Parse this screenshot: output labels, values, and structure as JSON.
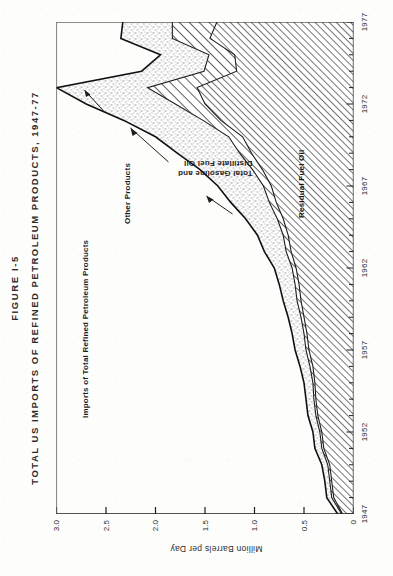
{
  "figure": {
    "number": "FIGURE I-5",
    "title": "TOTAL US IMPORTS OF REFINED PETROLEUM PRODUCTS, 1947-77"
  },
  "axes": {
    "y_axis_label": "Million Barrels per Day",
    "y_ticks": [
      "3.0",
      "2.5",
      "2.0",
      "1.5",
      "1.0",
      "0.5",
      "0"
    ],
    "x_ticks": [
      "1947",
      "1952",
      "1957",
      "1962",
      "1967",
      "1972",
      "1977"
    ]
  },
  "annotations": {
    "total_imports": "Imports of Total Refined Petroleum Products",
    "other_products": "Other Products",
    "gasoline_distillate": "Total Gasoline and\nDistillate Fuel Oil",
    "gasoline_distillate_line1": "Total Gasoline and",
    "gasoline_distillate_line2": "Distillate Fuel Oil",
    "residual": "Residual Fuel Oil"
  },
  "colors": {
    "ink": "#1d1d1d",
    "paper": "#fdfdfb",
    "stipple": "#bdbdbd",
    "hatch_dense": "#6f6f6f",
    "hatch_wide": "#4f4f4f"
  },
  "chart_data": {
    "type": "area",
    "title": "TOTAL US IMPORTS OF REFINED PETROLEUM PRODUCTS, 1947-77",
    "xlabel": "",
    "ylabel": "Million Barrels per Day",
    "ylim": [
      0,
      3.0
    ],
    "xlim": [
      1947,
      1977
    ],
    "grid": false,
    "legend": "in-plot annotations",
    "stacked": true,
    "x": [
      1947,
      1948,
      1949,
      1950,
      1951,
      1952,
      1953,
      1954,
      1955,
      1956,
      1957,
      1958,
      1959,
      1960,
      1961,
      1962,
      1963,
      1964,
      1965,
      1966,
      1967,
      1968,
      1969,
      1970,
      1971,
      1972,
      1973,
      1974,
      1975,
      1976,
      1977
    ],
    "series": [
      {
        "name": "Residual Fuel Oil",
        "fill": "dense-diagonal-hatch",
        "values": [
          0.11,
          0.2,
          0.22,
          0.24,
          0.3,
          0.32,
          0.36,
          0.38,
          0.39,
          0.41,
          0.45,
          0.47,
          0.5,
          0.53,
          0.55,
          0.58,
          0.63,
          0.66,
          0.71,
          0.78,
          0.83,
          0.92,
          1.03,
          1.12,
          1.34,
          1.5,
          1.58,
          1.18,
          1.2,
          1.45,
          1.38
        ]
      },
      {
        "name": "Total Gasoline and Distillate Fuel Oil",
        "fill": "wide-diagonal-hatch",
        "values": [
          0.01,
          0.02,
          0.02,
          0.02,
          0.02,
          0.02,
          0.02,
          0.02,
          0.02,
          0.03,
          0.03,
          0.03,
          0.03,
          0.04,
          0.04,
          0.04,
          0.05,
          0.05,
          0.06,
          0.07,
          0.08,
          0.1,
          0.12,
          0.14,
          0.18,
          0.3,
          0.5,
          0.33,
          0.26,
          0.38,
          0.45
        ]
      },
      {
        "name": "Other Products",
        "fill": "stipple",
        "values": [
          0.04,
          0.05,
          0.05,
          0.06,
          0.07,
          0.07,
          0.08,
          0.08,
          0.09,
          0.1,
          0.11,
          0.12,
          0.13,
          0.14,
          0.16,
          0.18,
          0.22,
          0.26,
          0.32,
          0.39,
          0.46,
          0.53,
          0.63,
          0.74,
          0.8,
          0.9,
          0.92,
          0.63,
          0.49,
          0.52,
          0.5
        ]
      }
    ],
    "total_series": {
      "name": "Imports of Total Refined Petroleum Products",
      "values": [
        0.16,
        0.27,
        0.29,
        0.32,
        0.39,
        0.41,
        0.46,
        0.48,
        0.5,
        0.54,
        0.59,
        0.62,
        0.66,
        0.71,
        0.75,
        0.8,
        0.9,
        0.97,
        1.09,
        1.24,
        1.37,
        1.55,
        1.78,
        2.0,
        2.32,
        2.7,
        3.0,
        2.14,
        1.95,
        2.35,
        2.33
      ]
    }
  }
}
